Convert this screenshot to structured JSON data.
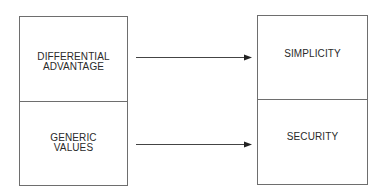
{
  "diagram": {
    "left_column": {
      "cells": [
        {
          "lines": [
            "DIFFERENTIAL",
            "ADVANTAGE"
          ]
        },
        {
          "lines": [
            "GENERIC",
            "VALUES"
          ]
        }
      ]
    },
    "right_column": {
      "cells": [
        {
          "lines": [
            "SIMPLICITY"
          ]
        },
        {
          "lines": [
            "SECURITY"
          ]
        }
      ]
    },
    "arrows": [
      {
        "from": "DIFFERENTIAL ADVANTAGE",
        "to": "SIMPLICITY"
      },
      {
        "from": "GENERIC VALUES",
        "to": "SECURITY"
      }
    ],
    "colors": {
      "border": "#6e6e6e",
      "text": "#2a2a2a",
      "arrow": "#333333"
    }
  }
}
